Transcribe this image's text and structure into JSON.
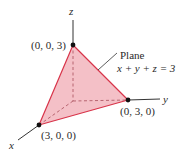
{
  "diagram": {
    "type": "3d-coordinate-plane",
    "axes": {
      "x_label": "x",
      "y_label": "y",
      "z_label": "z"
    },
    "points": [
      {
        "name": "z-intercept",
        "label": "(0, 0, 3)"
      },
      {
        "name": "y-intercept",
        "label": "(0, 3, 0)"
      },
      {
        "name": "x-intercept",
        "label": "(3, 0, 0)"
      }
    ],
    "annotation": {
      "title": "Plane",
      "equation": "x + y + z = 3"
    },
    "colors": {
      "plane_fill": "#f2b5bd",
      "plane_edge": "#d8344a",
      "axis": "#333333",
      "point": "#111111",
      "hidden_edge": "#b05a66"
    }
  }
}
